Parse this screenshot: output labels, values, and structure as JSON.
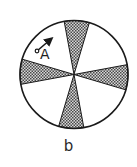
{
  "figure": {
    "caption": "b",
    "point_label": "A",
    "circle": {
      "cx": 74,
      "cy": 74.5,
      "r": 54
    },
    "wedge_half_angle_deg": 13.5,
    "wedge_axes_deg": [
      -87,
      3,
      93,
      183
    ],
    "rotation_note": "four shaded sectors arranged in a cross",
    "arrow": {
      "tail": [
        37,
        51
      ],
      "head": [
        51,
        39
      ]
    },
    "colors": {
      "outline": "#1a1a1a",
      "shading_dark": "#4a4a4a",
      "shading_light": "#d8d8d8",
      "background": "#ffffff"
    }
  }
}
